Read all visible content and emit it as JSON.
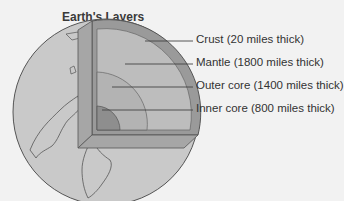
{
  "title": "Earth's Layers",
  "layers": [
    {
      "name": "Crust",
      "label": "Crust (20 miles thick)"
    },
    {
      "name": "Mantle",
      "label": "Mantle (1800 miles thick)"
    },
    {
      "name": "Outer core",
      "label": "Outer core (1400 miles thick)"
    },
    {
      "name": "Inner core",
      "label": "Inner core (800 miles thick)"
    }
  ],
  "colors": {
    "background": "#f2f2f2",
    "globe": "#c9c9c9",
    "crust": "#9a9a9a",
    "mantle": "#bdbdbd",
    "outer_core": "#b3b3b3",
    "inner_core": "#8e8e8e",
    "outline": "#555555"
  }
}
